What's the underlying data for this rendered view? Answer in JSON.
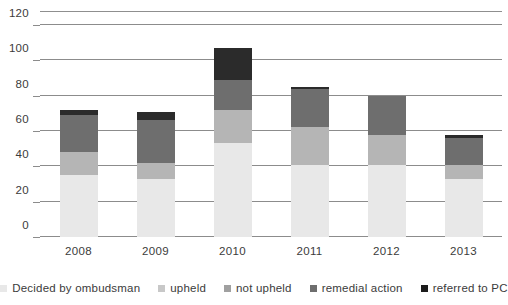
{
  "chart_data": {
    "type": "bar",
    "title": "",
    "subtitle": "",
    "xlabel": "",
    "ylabel": "",
    "stacked": true,
    "grid": true,
    "legend_position": "bottom",
    "ylim": [
      0,
      120
    ],
    "yticks": [
      0,
      20,
      40,
      60,
      80,
      100,
      120
    ],
    "ytick_labels": [
      "0",
      "20",
      "40",
      "60",
      "80",
      "100",
      "120"
    ],
    "categories": [
      "2008",
      "2009",
      "2010",
      "2011",
      "2012",
      "2013"
    ],
    "series": [
      {
        "name": "Decided by ombudsman",
        "color": "#e8e8e8",
        "values": [
          35,
          33,
          53,
          41,
          41,
          33
        ]
      },
      {
        "name": "upheld",
        "color": "#b5b5b5",
        "values": [
          13,
          9,
          19,
          21,
          17,
          8
        ]
      },
      {
        "name": "not upheld",
        "color": "#8a8a8a",
        "values": [
          0,
          0,
          0,
          0,
          0,
          0
        ]
      },
      {
        "name": "remedial action",
        "color": "#6e6e6e",
        "values": [
          21,
          24,
          17,
          22,
          22,
          15
        ]
      },
      {
        "name": "referred to PC",
        "color": "#2b2b2b",
        "values": [
          3,
          5,
          18,
          1,
          0,
          2
        ]
      }
    ],
    "totals": [
      72,
      71,
      107,
      85,
      80,
      58
    ]
  },
  "legend": {
    "items": [
      {
        "label": "Decided by ombudsman",
        "color": "#e8e8e8"
      },
      {
        "label": "upheld",
        "color": "#c8c8c8"
      },
      {
        "label": "not upheld",
        "color": "#a0a0a0"
      },
      {
        "label": "remedial action",
        "color": "#6e6e6e"
      },
      {
        "label": "referred to PC",
        "color": "#1c1c1c"
      }
    ]
  },
  "colors": {
    "gridline": "#8c8c8c",
    "text": "#3b3b3b",
    "background": "#ffffff"
  }
}
